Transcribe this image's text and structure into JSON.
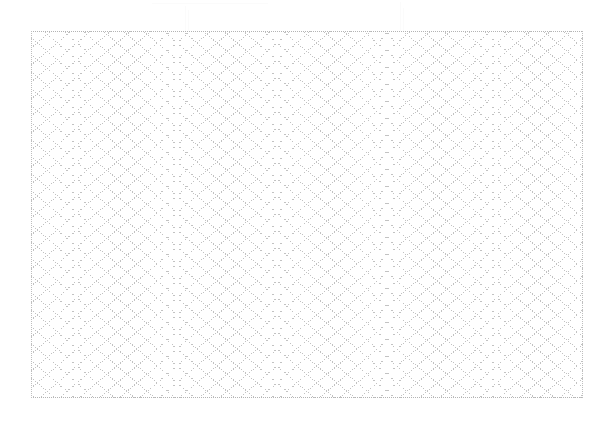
{
  "document": {
    "kind": "scanned-sheet",
    "page_width": 616,
    "page_height": 444,
    "background_color": "#ffffff"
  },
  "artifacts": {
    "description": "faint residual scanner marks in the upper margin above the sheet",
    "ghost_text": "",
    "ghost_color": "#fafafa",
    "vertical_rule_count": 4,
    "horizontal_rule_count": 1
  },
  "sheet": {
    "label": "lattice grid sheet",
    "x": 31,
    "y": 31,
    "width": 552,
    "height": 367,
    "fill_color": "#ffffff",
    "border_color": "#b9b9b9",
    "border_style": "dotted"
  },
  "chart_data": {
    "type": "grid",
    "title": "",
    "subtitle": "",
    "xlabel": "",
    "ylabel": "",
    "grid": true,
    "legend": null,
    "pattern": "diamond-lattice",
    "line_color": "#c2c2c2",
    "line_style": "dotted",
    "line_width": 1,
    "cell_width": 20,
    "cell_height": 17,
    "columns": 28,
    "rows": 22,
    "diagonal_sets": 2,
    "slope_down_angle_deg": -40,
    "slope_up_angle_deg": 40,
    "xlim": [
      0,
      552
    ],
    "ylim": [
      0,
      367
    ],
    "annotations": []
  }
}
